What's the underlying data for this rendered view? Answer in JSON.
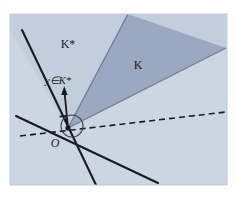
{
  "figure": {
    "panel": {
      "x": 10,
      "y": 14,
      "width": 217,
      "height": 171,
      "background_color": "#ccd6e2",
      "border_color": "#b9c4d2"
    },
    "colors": {
      "page_background": "#ffffff",
      "light_cone_fill": "#c3cedd",
      "dark_cone_fill": "#9aa8c2",
      "plane_fill": "#ccd6e2",
      "line_color": "#1a1a20",
      "dark_cone_edge": "#6d7c98",
      "label_color": "#1a1a20"
    },
    "origin": {
      "x": 68,
      "y": 128,
      "label": "O"
    },
    "labels": [
      {
        "id": "label-k-star",
        "text": "K*",
        "x": 68,
        "y": 44,
        "font_size": 11,
        "describes": "dual cone region"
      },
      {
        "id": "label-k",
        "text": "K",
        "x": 138,
        "y": 65,
        "font_size": 11,
        "describes": "primal cone region"
      },
      {
        "id": "label-y-in-k-star",
        "text": "y∈K*",
        "x": 45,
        "y": 82,
        "font_size": 10,
        "describes": "vector y belonging to the dual cone"
      },
      {
        "id": "label-origin",
        "text": "O",
        "x": 58,
        "y": 143,
        "font_size": 11,
        "describes": "origin point"
      }
    ],
    "vector": {
      "name": "y",
      "from_x": 68,
      "from_y": 128,
      "to_x": 64,
      "to_y": 88,
      "arrowhead": true
    },
    "right_angle_marker": {
      "x": 64,
      "y": 116,
      "size": 7
    },
    "angle_arc": {
      "cx": 72,
      "cy": 126,
      "r": 11
    },
    "dashed_line": {
      "from_x": 20,
      "from_y": 136,
      "to_x": 226,
      "to_y": 112,
      "dash_pattern": "6,4"
    },
    "solid_lines": [
      {
        "id": "boundary-upper-left",
        "from_x": 22,
        "from_y": 30,
        "to_x": 96,
        "to_y": 185
      },
      {
        "id": "boundary-lower-right",
        "from_x": 18,
        "from_y": 118,
        "to_x": 157,
        "to_y": 182
      }
    ],
    "cone_k": {
      "apex_x": 68,
      "apex_y": 128,
      "edge_a_x": 128,
      "edge_a_y": 14,
      "edge_b_x": 226,
      "edge_b_y": 48
    },
    "cone_k_star": {
      "apex_x": 68,
      "apex_y": 128,
      "edge_a_x": 22,
      "edge_a_y": 30,
      "edge_b_x": 226,
      "edge_b_y": 48
    }
  }
}
